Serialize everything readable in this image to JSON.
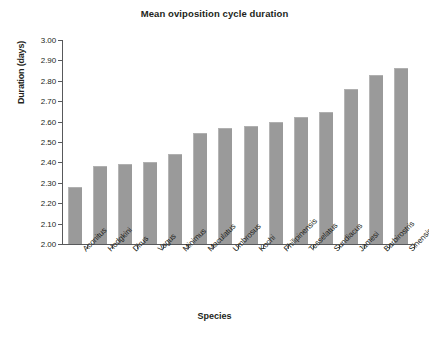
{
  "chart_data": {
    "type": "bar",
    "title": "Mean oviposition cycle duration",
    "xlabel": "Species",
    "ylabel": "Duration (days)",
    "ylim": [
      2.0,
      3.0
    ],
    "ytick_step": 0.1,
    "ytick_labels": [
      "3.00",
      "2.90",
      "2.80",
      "2.70",
      "2.60",
      "2.50",
      "2.40",
      "2.30",
      "2.20",
      "2.10",
      "2.00"
    ],
    "grid": false,
    "legend": false,
    "bar_color": "#9a9a9a",
    "axis_color": "#58595b",
    "background": "#ffffff",
    "categories": [
      "Aconitus",
      "Hodgkini",
      "Dirus",
      "Vagus",
      "Minimus",
      "Maculatus",
      "Umbrosus",
      "Kochi",
      "Philipinensis",
      "Tesselatus",
      "Sundiacus",
      "Jamesi",
      "Barbirostris",
      "Sinensis"
    ],
    "values": [
      2.28,
      2.38,
      2.39,
      2.4,
      2.44,
      2.545,
      2.57,
      2.58,
      2.6,
      2.625,
      2.645,
      2.76,
      2.83,
      2.865
    ]
  }
}
